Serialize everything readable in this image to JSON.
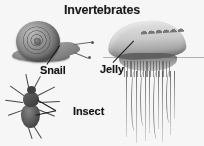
{
  "figure": {
    "title": "Invertebrates",
    "background_color": "#f7f6f4",
    "style": "grayscale halftone illustration"
  },
  "labels": [
    {
      "id": "snail",
      "text": "Snail",
      "points_to": "snail-illustration"
    },
    {
      "id": "insect",
      "text": "Insect",
      "points_to": "insect-illustration"
    },
    {
      "id": "jelly",
      "text": "Jelly",
      "points_to": "jellyfish-illustration"
    }
  ],
  "organisms": {
    "snail": {
      "label": "Snail",
      "parts": [
        "spiral-shell",
        "foot",
        "head",
        "tentacles"
      ],
      "shell_color": "#8d867c",
      "body_color": "#7d776e"
    },
    "insect": {
      "label": "Insect",
      "parts": [
        "head",
        "thorax",
        "abdomen",
        "six-legs",
        "antennae"
      ],
      "body_color": "#4c463f"
    },
    "jelly": {
      "label": "Jelly",
      "parts": [
        "bell",
        "crest",
        "oral-arms",
        "tentacles"
      ],
      "bell_color": "#cfcbc4",
      "tentacle_color": "#6f6a63"
    }
  }
}
